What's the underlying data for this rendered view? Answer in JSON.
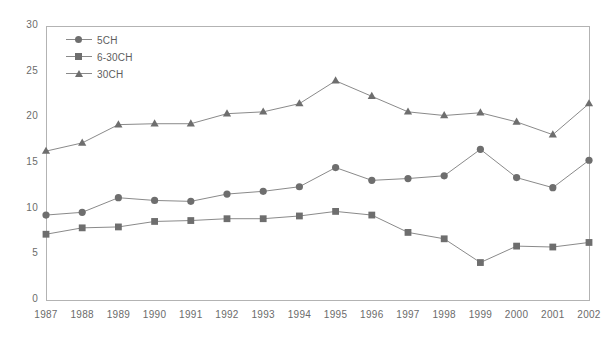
{
  "chart_data": {
    "type": "line",
    "title": "",
    "xlabel": "",
    "ylabel": "",
    "grid": false,
    "legend_position": "top-left-inside",
    "xlim": [
      1987,
      2002
    ],
    "ylim": [
      0,
      30
    ],
    "yticks": [
      0,
      5,
      10,
      15,
      20,
      25,
      30
    ],
    "categories": [
      "1987",
      "1988",
      "1989",
      "1990",
      "1991",
      "1992",
      "1993",
      "1994",
      "1995",
      "1996",
      "1997",
      "1998",
      "1999",
      "2000",
      "2001",
      "2002"
    ],
    "series": [
      {
        "name": "5CH",
        "marker": "circle",
        "color": "#6e6e6e",
        "values": [
          9.3,
          9.6,
          11.2,
          10.9,
          10.8,
          11.6,
          11.9,
          12.4,
          14.5,
          13.1,
          13.3,
          13.6,
          16.5,
          13.4,
          12.3,
          15.3
        ]
      },
      {
        "name": "6-30CH",
        "marker": "square",
        "color": "#6e6e6e",
        "values": [
          7.2,
          7.9,
          8.0,
          8.6,
          8.7,
          8.9,
          8.9,
          9.2,
          9.7,
          9.3,
          7.4,
          6.7,
          4.1,
          5.9,
          5.8,
          6.3
        ]
      },
      {
        "name": "30CH",
        "marker": "triangle",
        "color": "#6e6e6e",
        "values": [
          16.3,
          17.2,
          19.2,
          19.3,
          19.3,
          20.4,
          20.6,
          21.5,
          24.0,
          22.3,
          20.6,
          20.2,
          20.5,
          19.5,
          18.1,
          21.5
        ]
      }
    ]
  },
  "legend": {
    "entries": [
      {
        "label": "5CH"
      },
      {
        "label": "6-30CH"
      },
      {
        "label": "30CH"
      }
    ]
  },
  "axes": {
    "y_labels": [
      "30",
      "25",
      "20",
      "15",
      "10",
      "5",
      "0"
    ],
    "x_labels": [
      "1987",
      "1988",
      "1989",
      "1990",
      "1991",
      "1992",
      "1993",
      "1994",
      "1995",
      "1996",
      "1997",
      "1998",
      "1999",
      "2000",
      "2001",
      "2002"
    ]
  },
  "colors": {
    "series": "#6e6e6e",
    "line": "#8a8a8a",
    "frame": "#b3b3b3",
    "text": "#6b6b6b"
  }
}
